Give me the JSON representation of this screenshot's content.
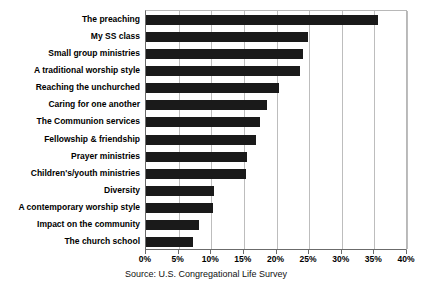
{
  "chart_data": {
    "type": "bar",
    "orientation": "horizontal",
    "title": "",
    "subtitle": "",
    "xlabel": "",
    "ylabel": "",
    "xlim": [
      0,
      40
    ],
    "xtick_step": 5,
    "xtick_labels": [
      "0%",
      "5%",
      "10%",
      "15%",
      "20%",
      "25%",
      "30%",
      "35%",
      "40%"
    ],
    "xtick_values": [
      0,
      5,
      10,
      15,
      20,
      25,
      30,
      35,
      40
    ],
    "grid": "vertical",
    "legend": "none",
    "bar_color": "#1a1a1a",
    "categories": [
      "The preaching",
      "My SS class",
      "Small group ministries",
      "A traditional worship style",
      "Reaching the unchurched",
      "Caring for one another",
      "The Communion services",
      "Fellowship & friendship",
      "Prayer ministries",
      "Children's/youth ministries",
      "Diversity",
      "A contemporary worship style",
      "Impact on the community",
      "The church school"
    ],
    "values": [
      35.6,
      24.9,
      24.0,
      23.6,
      20.4,
      18.6,
      17.4,
      16.8,
      15.5,
      15.4,
      10.4,
      10.3,
      8.1,
      7.2
    ],
    "annotations": [
      "Source: U.S. Congregational Life Survey"
    ]
  },
  "source_note": "Source: U.S. Congregational Life Survey"
}
